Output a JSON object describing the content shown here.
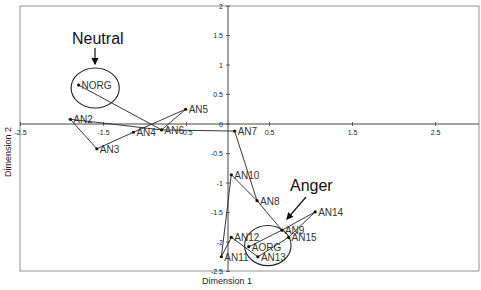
{
  "chart_data": {
    "type": "scatter",
    "title": "",
    "xlabel": "Dimension 1",
    "ylabel": "Dimension 2",
    "xlim": [
      -2.5,
      3.0
    ],
    "ylim": [
      -2.5,
      2
    ],
    "grid": false,
    "legend": null,
    "x_ticks": [
      "-2.5",
      "-1.5",
      "-0.5",
      "0.5",
      "1.5",
      "2.5"
    ],
    "y_ticks": [
      "2",
      "1.5",
      "1",
      "0.5",
      "0",
      "-0.5",
      "-1",
      "-1.5",
      "-2",
      "-2.5"
    ],
    "points": [
      {
        "label": "NORG",
        "x": -1.8,
        "y": 0.66
      },
      {
        "label": "AN2",
        "x": -1.9,
        "y": 0.08
      },
      {
        "label": "AN3",
        "x": -1.58,
        "y": -0.42
      },
      {
        "label": "AN4",
        "x": -1.14,
        "y": -0.14
      },
      {
        "label": "AN5",
        "x": -0.51,
        "y": 0.25
      },
      {
        "label": "AN6",
        "x": -0.8,
        "y": -0.1
      },
      {
        "label": "AN7",
        "x": 0.08,
        "y": -0.12
      },
      {
        "label": "AN8",
        "x": 0.35,
        "y": -1.3
      },
      {
        "label": "AN9",
        "x": 0.65,
        "y": -1.8
      },
      {
        "label": "AN10",
        "x": 0.04,
        "y": -0.86
      },
      {
        "label": "AN11",
        "x": -0.08,
        "y": -2.25
      },
      {
        "label": "AN12",
        "x": 0.04,
        "y": -1.92
      },
      {
        "label": "AN13",
        "x": 0.36,
        "y": -2.25
      },
      {
        "label": "AN14",
        "x": 1.05,
        "y": -1.49
      },
      {
        "label": "AN15",
        "x": 0.73,
        "y": -1.92
      },
      {
        "label": "AORG",
        "x": 0.25,
        "y": -2.08
      }
    ],
    "edges": [
      [
        "NORG",
        "AN6"
      ],
      [
        "AN2",
        "AN6"
      ],
      [
        "AN2",
        "AN3"
      ],
      [
        "AN3",
        "AN4"
      ],
      [
        "AN4",
        "AN5"
      ],
      [
        "AN5",
        "AN6"
      ],
      [
        "AN6",
        "AN7"
      ],
      [
        "AN7",
        "AN8"
      ],
      [
        "AN10",
        "AN8"
      ],
      [
        "AN10",
        "AN11"
      ],
      [
        "AN11",
        "AN12"
      ],
      [
        "AN12",
        "AN13"
      ],
      [
        "AN13",
        "AN15"
      ],
      [
        "AORG",
        "AN9"
      ],
      [
        "AN8",
        "AN9"
      ],
      [
        "AN9",
        "AN14"
      ],
      [
        "AN14",
        "AN15"
      ]
    ],
    "annotations": [
      {
        "text": "Neutral",
        "target": "NORG",
        "ellipse": {
          "cx": -1.6,
          "cy": 0.61,
          "rx": 0.29,
          "ry": 0.34
        }
      },
      {
        "text": "Anger",
        "target": "AORG",
        "ellipse": {
          "cx": 0.48,
          "cy": -2.06,
          "rx": 0.28,
          "ry": 0.34
        }
      }
    ]
  }
}
